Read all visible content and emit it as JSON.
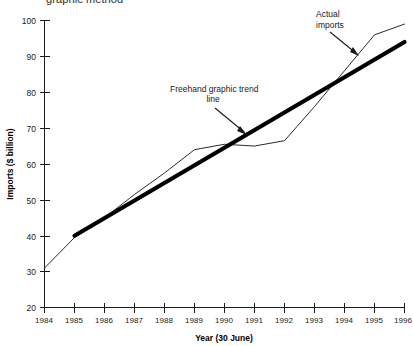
{
  "title_clipped": "graphic method",
  "chart_data": {
    "type": "line",
    "title": "graphic method",
    "xlabel": "Year (30 June)",
    "ylabel": "Imports ($ billion)",
    "xlim": [
      1984,
      1996
    ],
    "ylim": [
      20,
      100
    ],
    "ytick_step": 10,
    "grid": false,
    "legend": "none",
    "x": [
      1984,
      1985,
      1986,
      1987,
      1988,
      1989,
      1990,
      1991,
      1992,
      1993,
      1994,
      1995,
      1996
    ],
    "categories": [
      "1984",
      "1985",
      "1986",
      "1987",
      "1988",
      "1989",
      "1990",
      "1991",
      "1992",
      "1993",
      "1994",
      "1995",
      "1996"
    ],
    "yticks": [
      20,
      30,
      40,
      50,
      60,
      70,
      80,
      90,
      100
    ],
    "series": [
      {
        "name": "Actual imports",
        "values": [
          31,
          39.5,
          45,
          51.5,
          57.5,
          64,
          65.5,
          65,
          66.5,
          76,
          86,
          96,
          99
        ]
      },
      {
        "name": "Freehand graphic trend line",
        "x": [
          1985,
          1996
        ],
        "values": [
          40,
          94
        ]
      }
    ],
    "annotations": [
      {
        "label": "Actual imports",
        "target_x": 1995,
        "target_y": 94
      },
      {
        "label": "Freehand graphic trend line",
        "target_x": 1990,
        "target_y": 70
      }
    ]
  },
  "axis": {
    "y_label": "Imports ($ billion)",
    "x_label": "Year (30 June)",
    "y_ticks": [
      "100",
      "90",
      "80",
      "70",
      "60",
      "50",
      "40",
      "30",
      "20"
    ],
    "x_ticks": [
      "1984",
      "1985",
      "1986",
      "1987",
      "1988",
      "1989",
      "1990",
      "1991",
      "1992",
      "1993",
      "1994",
      "1995",
      "1996"
    ]
  },
  "annotations": {
    "actual_imports_line1": "Actual",
    "actual_imports_line2": "imports",
    "trend_line1": "Freehand graphic trend",
    "trend_line2": "line"
  },
  "colors": {
    "axis": "#1a1a1a",
    "actual_series": "#2a2a2a",
    "trend_series": "#000000",
    "background": "#ffffff"
  }
}
